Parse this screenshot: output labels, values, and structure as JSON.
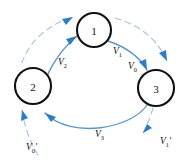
{
  "figure": {
    "type": "cycle-diagram",
    "background": "#ffffff",
    "colors": {
      "node_stroke": "#111111",
      "node_fill": "#ffffff",
      "arc_solid": "#5b96c8",
      "arc_dashed": "#a8c4db",
      "arrowhead": "#2e7cc4",
      "label_text": "#111111"
    }
  },
  "nodes": [
    {
      "id": "node-1",
      "label": "1",
      "cx": 94,
      "cy": 30,
      "r": 17
    },
    {
      "id": "node-2",
      "label": "2",
      "cx": 33,
      "cy": 86,
      "r": 18
    },
    {
      "id": "node-3",
      "label": "3",
      "cx": 156,
      "cy": 88,
      "r": 18
    }
  ],
  "labels": [
    {
      "id": "label-v1",
      "base": "V",
      "sub": "1",
      "prime": false,
      "left": 113,
      "top": 47
    },
    {
      "id": "label-v0",
      "base": "V",
      "sub": "0",
      "prime": false,
      "left": 128,
      "top": 62
    },
    {
      "id": "label-v2",
      "base": "V",
      "sub": "2",
      "prime": false,
      "left": 58,
      "top": 58
    },
    {
      "id": "label-v3",
      "base": "V",
      "sub": "3",
      "prime": false,
      "left": 95,
      "top": 130
    },
    {
      "id": "label-v0-prime",
      "base": "V",
      "sub": "0",
      "prime": true,
      "left": 26,
      "top": 143
    },
    {
      "id": "label-v1-prime",
      "base": "V",
      "sub": "1",
      "prime": true,
      "left": 160,
      "top": 137
    }
  ],
  "arcs": [
    {
      "id": "arc-2-to-1-dashed",
      "style": "dashed",
      "from": "2",
      "to": "1",
      "label": ""
    },
    {
      "id": "arc-2-to-1-solid",
      "style": "solid",
      "from": "2",
      "to": "1",
      "label": "V2"
    },
    {
      "id": "arc-1-to-3-dashed",
      "style": "dashed",
      "from": "1",
      "to": "3",
      "label": "V1"
    },
    {
      "id": "arc-1-to-3-solid",
      "style": "solid",
      "from": "1",
      "to": "3",
      "label": "V0"
    },
    {
      "id": "arc-3-to-2-solid",
      "style": "solid",
      "from": "3",
      "to": "2",
      "label": "V3"
    },
    {
      "id": "arc-3-to-2-dashed",
      "style": "dashed",
      "from": "3",
      "to": "2",
      "label": "V0prime"
    },
    {
      "id": "arc-3-out-dashed",
      "style": "dashed",
      "from": "3",
      "to": "out",
      "label": "V1prime"
    }
  ]
}
